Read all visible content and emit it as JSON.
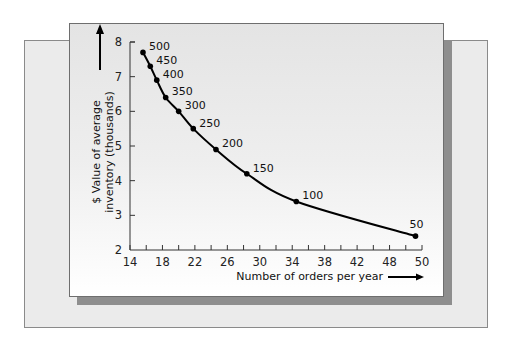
{
  "chart_data": {
    "type": "line",
    "title": "",
    "xlabel": "Number of orders per year",
    "ylabel": "$ Value of average inventory (thousands)",
    "ylabel_lines": [
      "$ Value of average",
      "inventory (thousands)"
    ],
    "xlim": [
      14,
      50
    ],
    "ylim": [
      2,
      8
    ],
    "x_ticks": [
      14,
      18,
      22,
      26,
      30,
      34,
      38,
      42,
      46,
      50
    ],
    "x_tick_labels": [
      "14",
      "18",
      "22",
      "26",
      "30",
      "34",
      "38",
      "42",
      "48",
      "50"
    ],
    "y_ticks": [
      2,
      3,
      4,
      5,
      6,
      7,
      8
    ],
    "y_tick_labels": [
      "2",
      "3",
      "4",
      "5",
      "6",
      "7",
      "8"
    ],
    "grid": false,
    "legend": null,
    "series": [
      {
        "name": "Order quantity",
        "points": [
          {
            "label": "500",
            "x": 15.6,
            "y": 7.7
          },
          {
            "label": "450",
            "x": 16.5,
            "y": 7.3
          },
          {
            "label": "400",
            "x": 17.3,
            "y": 6.9
          },
          {
            "label": "350",
            "x": 18.4,
            "y": 6.4
          },
          {
            "label": "300",
            "x": 20.0,
            "y": 6.0
          },
          {
            "label": "250",
            "x": 21.8,
            "y": 5.5
          },
          {
            "label": "200",
            "x": 24.6,
            "y": 4.9
          },
          {
            "label": "150",
            "x": 28.4,
            "y": 4.2
          },
          {
            "label": "100",
            "x": 34.5,
            "y": 3.4
          },
          {
            "label": "50",
            "x": 49.2,
            "y": 2.4
          }
        ]
      }
    ],
    "annotations": [
      "axis arrows pointing up (y) and right (x)"
    ]
  },
  "colors": {
    "line": "#000000",
    "front_panel": "#eeeeee",
    "back_panel": "#ebebeb",
    "shadow": "#8e8e8e"
  }
}
